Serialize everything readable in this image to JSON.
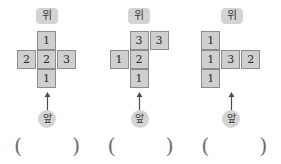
{
  "page": {
    "kind": "math-worksheet-figures",
    "figure_count": 3,
    "accent_gray": "#cfcfcf",
    "border_gray": "#8c8c8c",
    "label_gray": "#d4d4d4"
  },
  "labels": {
    "top_label": "위",
    "front_label": "앞",
    "paren_open": "(",
    "paren_close": ")"
  },
  "figures": [
    {
      "id": "figure-1",
      "shape": "plus",
      "top_label": "위",
      "front_label": "앞",
      "rows": [
        [
          null,
          "1",
          null
        ],
        [
          "2",
          "2",
          "3"
        ],
        [
          null,
          "1",
          null
        ]
      ],
      "answer": ""
    },
    {
      "id": "figure-2",
      "shape": "offset-t",
      "top_label": "위",
      "front_label": "앞",
      "rows": [
        [
          null,
          "3",
          "3"
        ],
        [
          "1",
          "2",
          null
        ],
        [
          null,
          "1",
          null
        ]
      ],
      "answer": ""
    },
    {
      "id": "figure-3",
      "shape": "left-column-with-arm",
      "top_label": "위",
      "front_label": "앞",
      "rows": [
        [
          "1",
          null,
          null
        ],
        [
          "1",
          "3",
          "2"
        ],
        [
          "1",
          null,
          null
        ]
      ],
      "answer": ""
    }
  ]
}
